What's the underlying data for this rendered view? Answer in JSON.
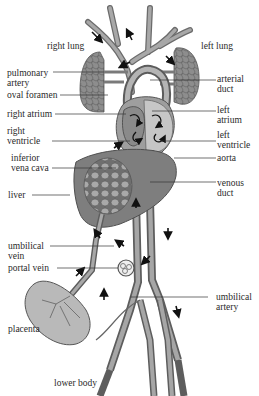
{
  "figure": {
    "labels": {
      "right_lung": "right lung",
      "left_lung": "left lung",
      "pulmonary_artery": "pulmonary\nartery",
      "oval_foramen": "oval foramen",
      "arterial_duct": "arterial\nduct",
      "right_atrium": "right atrium",
      "left_atrium": "left\natrium",
      "right_ventricle": "right\nventricle",
      "left_ventricle": "left\nventricle",
      "inferior_vena_cava": "inferior\nvena cava",
      "aorta": "aorta",
      "liver": "liver",
      "venous_duct": "venous\nduct",
      "umbilical_vein": "umbilical\nvein",
      "portal_vein": "portal vein",
      "umbilical_artery": "umbilical\nartery",
      "placenta": "placenta",
      "lower_body": "lower body"
    },
    "colors": {
      "vessel": "#8a8a8a",
      "vessel_dark": "#5a5a5a",
      "vessel_light": "#c4c4c4",
      "organ": "#7d7d7d",
      "heart_light": "#bdbdbd",
      "line": "#333333",
      "arrow": "#111111"
    }
  }
}
